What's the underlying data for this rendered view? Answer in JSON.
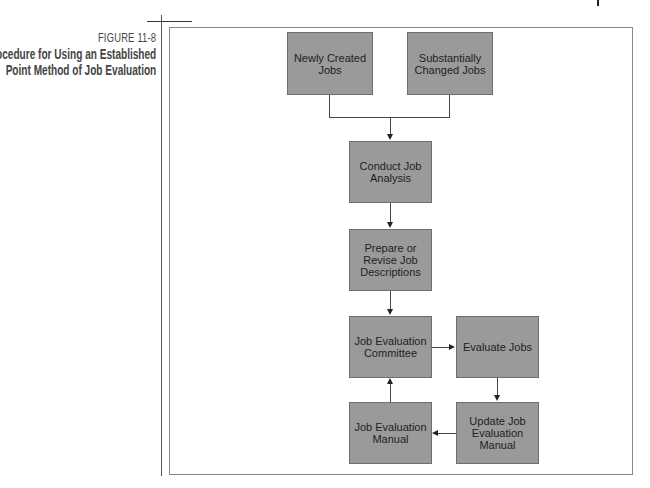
{
  "figure": {
    "number": "FIGURE 11-8",
    "title_lines": [
      "Procedure for Using an Established",
      "Point Method of Job Evaluation"
    ]
  },
  "colors": {
    "box_fill": "#9a9a9a",
    "box_border": "#6e6e6e",
    "line": "#444444",
    "frame": "#8a8a8a"
  },
  "nodes": {
    "newly_created": "Newly Created Jobs",
    "substantially_changed": "Substantially Changed Jobs",
    "conduct_analysis": "Conduct Job Analysis",
    "prepare_descriptions": "Prepare or Revise Job Descriptions",
    "committee": "Job Evaluation Committee",
    "evaluate": "Evaluate Jobs",
    "manual": "Job Evaluation Manual",
    "update_manual": "Update Job Evaluation Manual"
  },
  "edges": [
    {
      "from": "newly_created",
      "to": "conduct_analysis"
    },
    {
      "from": "substantially_changed",
      "to": "conduct_analysis"
    },
    {
      "from": "conduct_analysis",
      "to": "prepare_descriptions"
    },
    {
      "from": "prepare_descriptions",
      "to": "committee"
    },
    {
      "from": "committee",
      "to": "evaluate"
    },
    {
      "from": "evaluate",
      "to": "update_manual"
    },
    {
      "from": "update_manual",
      "to": "manual"
    },
    {
      "from": "manual",
      "to": "committee"
    }
  ]
}
